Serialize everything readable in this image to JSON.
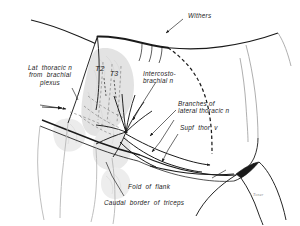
{
  "figure": {
    "background_color": "#ffffff",
    "ink_color": "#1a1a1a",
    "faint_color": "#d8d8d8"
  },
  "labels": {
    "withers": "Withers",
    "lat_thoracic": "Lat  thoracic n\nfrom  brachial\nplexus",
    "intercostobrachial": "Intercosto-\nbrachial n",
    "branches_lateral": "Branches of\nlateral thoracic n",
    "supf_thor_v": "Supf  thor  v",
    "fold_of_flank": "Fold  of  flank",
    "caudal_border_triceps": "Caudal  border  of  triceps",
    "t2": "T2",
    "t3": "T3"
  },
  "signature": {
    "text": "Toner"
  },
  "colors": {
    "outline": "#1a1a1a",
    "dashed_guide": "#1a1a1a",
    "shading": "#dcdcdc",
    "leader": "#555555",
    "signature": "#8a8a8a"
  }
}
